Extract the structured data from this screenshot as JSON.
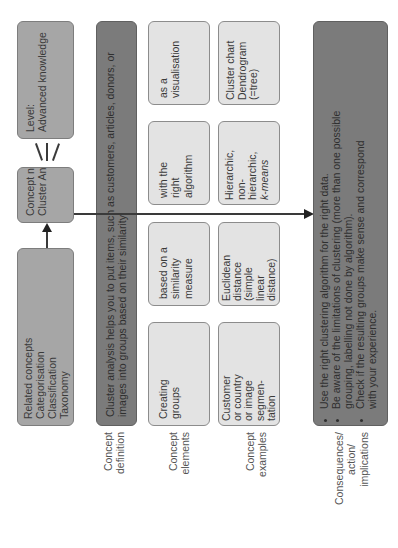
{
  "diagram": {
    "orientation": "rotated -90deg (reads bottom-to-top)",
    "level_box": {
      "lines": [
        "Level:",
        "Advanced knowledge"
      ]
    },
    "concept_name_box": {
      "lines": [
        "Concept name",
        "Cluster Analysis"
      ]
    },
    "related_concepts_box": {
      "lines": [
        "Related concepts",
        "Categorisation",
        "Classification",
        "Taxonomy"
      ]
    },
    "definition_box": {
      "lines": [
        "Cluster analysis helps you to put items, such as customers, articles, donors, or",
        "images into groups based on their similarity."
      ]
    },
    "elements": [
      {
        "lines": [
          "Creating",
          "groups"
        ]
      },
      {
        "lines": [
          "based on a",
          "similarity",
          "measure"
        ]
      },
      {
        "lines": [
          "with the",
          "right",
          "algorithm"
        ]
      },
      {
        "lines": [
          "as a",
          "visualisation"
        ]
      }
    ],
    "examples": [
      {
        "lines": [
          "Customer",
          "or country",
          "or image",
          "segmen-",
          "tation"
        ]
      },
      {
        "lines": [
          "Euclidean",
          "distance",
          "(simple",
          "linear",
          "distance)"
        ]
      },
      {
        "lines": [
          "Hierarchic,",
          "non-",
          "hierarchic,",
          "k-means"
        ]
      },
      {
        "lines": [
          "Cluster chart",
          "Dendrogram",
          "(=tree)"
        ]
      }
    ],
    "consequences_box": {
      "bullets": [
        "Use the right clustering algorithm for the right data.",
        "Be aware of the limitations of clustering (more than one possible grouping, labelling not done by algorithm).",
        "Check if the resulting groups make sense and correspond with your experience."
      ]
    },
    "row_labels": {
      "definition": [
        "Concept",
        "definition"
      ],
      "elements": [
        "Concept",
        "elements"
      ],
      "examples": [
        "Concept",
        "examples"
      ],
      "consequences": [
        "Consequences/",
        "action/",
        "implications"
      ]
    }
  }
}
